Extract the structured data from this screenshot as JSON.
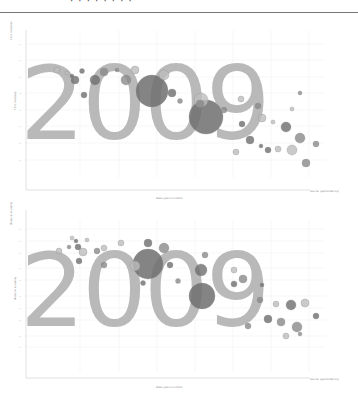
{
  "header": {
    "title": "· ·  · · · · · ·",
    "note": "top caption cut off at image edge"
  },
  "colors": {
    "year_watermark": "#b9b9b9",
    "bubble_dark": "#6e6e6e",
    "bubble_mid": "#8a8a8a",
    "bubble_light": "#bdbdbd",
    "grid": "#eeeeee",
    "axis": "#cccccc"
  },
  "chart_data": [
    {
      "type": "scatter",
      "subtype": "bubble",
      "title": "",
      "watermark": "2009",
      "xlabel": "Mean years in school",
      "ylabel": "Child mortality",
      "x_ticks": [
        "",
        "",
        "",
        "",
        "",
        ""
      ],
      "y_ticks": [
        "",
        "",
        "",
        "",
        "",
        "",
        "",
        ""
      ],
      "grid": true,
      "legend": "",
      "source_note": "",
      "points": [
        {
          "x": 57,
          "y": 70,
          "r": 3
        },
        {
          "x": 67,
          "y": 73,
          "r": 2
        },
        {
          "x": 72,
          "y": 76,
          "r": 2
        },
        {
          "x": 75,
          "y": 80,
          "r": 4
        },
        {
          "x": 82,
          "y": 71,
          "r": 2.5
        },
        {
          "x": 84,
          "y": 95,
          "r": 3
        },
        {
          "x": 95,
          "y": 80,
          "r": 5
        },
        {
          "x": 104,
          "y": 72,
          "r": 4
        },
        {
          "x": 117,
          "y": 70,
          "r": 2
        },
        {
          "x": 126,
          "y": 80,
          "r": 5
        },
        {
          "x": 152,
          "y": 91,
          "r": 16
        },
        {
          "x": 135,
          "y": 70,
          "r": 4
        },
        {
          "x": 164,
          "y": 75,
          "r": 5
        },
        {
          "x": 172,
          "y": 93,
          "r": 4
        },
        {
          "x": 180,
          "y": 101,
          "r": 2.5
        },
        {
          "x": 200,
          "y": 104,
          "r": 4
        },
        {
          "x": 206,
          "y": 117,
          "r": 17
        },
        {
          "x": 201,
          "y": 100,
          "r": 7
        },
        {
          "x": 224,
          "y": 110,
          "r": 3
        },
        {
          "x": 241,
          "y": 99,
          "r": 3
        },
        {
          "x": 242,
          "y": 124,
          "r": 3
        },
        {
          "x": 258,
          "y": 106,
          "r": 3
        },
        {
          "x": 262,
          "y": 118,
          "r": 4
        },
        {
          "x": 273,
          "y": 122,
          "r": 2
        },
        {
          "x": 286,
          "y": 127,
          "r": 5
        },
        {
          "x": 300,
          "y": 138,
          "r": 5
        },
        {
          "x": 292,
          "y": 150,
          "r": 5
        },
        {
          "x": 278,
          "y": 149,
          "r": 3
        },
        {
          "x": 268,
          "y": 150,
          "r": 3
        },
        {
          "x": 261,
          "y": 146,
          "r": 2
        },
        {
          "x": 250,
          "y": 140,
          "r": 4
        },
        {
          "x": 316,
          "y": 144,
          "r": 3
        },
        {
          "x": 306,
          "y": 163,
          "r": 4
        },
        {
          "x": 300,
          "y": 93,
          "r": 2
        },
        {
          "x": 292,
          "y": 109,
          "r": 2
        },
        {
          "x": 236,
          "y": 152,
          "r": 3
        }
      ]
    },
    {
      "type": "scatter",
      "subtype": "bubble",
      "title": "",
      "watermark": "2009",
      "xlabel": "Mean years in school",
      "ylabel": "Maternal mortality",
      "x_ticks": [
        "",
        "",
        "",
        "",
        "",
        ""
      ],
      "y_ticks": [
        "",
        "",
        "",
        "",
        "",
        "",
        "",
        "",
        "",
        "",
        ""
      ],
      "grid": true,
      "legend": "",
      "source_note": "",
      "points": [
        {
          "x": 72,
          "y": 238,
          "r": 2
        },
        {
          "x": 76,
          "y": 241,
          "r": 2
        },
        {
          "x": 59,
          "y": 251,
          "r": 3
        },
        {
          "x": 69,
          "y": 247,
          "r": 2
        },
        {
          "x": 78,
          "y": 247,
          "r": 3
        },
        {
          "x": 83,
          "y": 252,
          "r": 4
        },
        {
          "x": 87,
          "y": 240,
          "r": 2
        },
        {
          "x": 97,
          "y": 251,
          "r": 3
        },
        {
          "x": 104,
          "y": 248,
          "r": 3
        },
        {
          "x": 79,
          "y": 261,
          "r": 3
        },
        {
          "x": 104,
          "y": 265,
          "r": 3
        },
        {
          "x": 121,
          "y": 243,
          "r": 3
        },
        {
          "x": 148,
          "y": 264,
          "r": 15
        },
        {
          "x": 148,
          "y": 243,
          "r": 4
        },
        {
          "x": 164,
          "y": 248,
          "r": 5
        },
        {
          "x": 135,
          "y": 266,
          "r": 5
        },
        {
          "x": 170,
          "y": 265,
          "r": 3
        },
        {
          "x": 143,
          "y": 283,
          "r": 2.5
        },
        {
          "x": 178,
          "y": 281,
          "r": 2.5
        },
        {
          "x": 202,
          "y": 296,
          "r": 13
        },
        {
          "x": 201,
          "y": 270,
          "r": 6
        },
        {
          "x": 205,
          "y": 255,
          "r": 3
        },
        {
          "x": 234,
          "y": 270,
          "r": 3
        },
        {
          "x": 234,
          "y": 284,
          "r": 3
        },
        {
          "x": 243,
          "y": 279,
          "r": 4
        },
        {
          "x": 262,
          "y": 285,
          "r": 2
        },
        {
          "x": 260,
          "y": 300,
          "r": 3
        },
        {
          "x": 276,
          "y": 304,
          "r": 3
        },
        {
          "x": 291,
          "y": 305,
          "r": 5
        },
        {
          "x": 305,
          "y": 303,
          "r": 4
        },
        {
          "x": 268,
          "y": 319,
          "r": 4
        },
        {
          "x": 281,
          "y": 322,
          "r": 4
        },
        {
          "x": 297,
          "y": 327,
          "r": 5
        },
        {
          "x": 316,
          "y": 316,
          "r": 3
        },
        {
          "x": 248,
          "y": 326,
          "r": 3
        },
        {
          "x": 286,
          "y": 336,
          "r": 3
        },
        {
          "x": 300,
          "y": 334,
          "r": 2
        }
      ]
    }
  ],
  "charts": [
    {
      "watermark": "2009",
      "xlabel": "Mean years in school",
      "ylabel": "Child mortality",
      "y_axis_title_top": "Child mortality",
      "source_note": "Source: gapminder.org"
    },
    {
      "watermark": "2009",
      "xlabel": "Mean years in school",
      "ylabel": "Maternal mortality",
      "y_axis_title_top": "Maternal mortality",
      "source_note": "Source: gapminder.org"
    }
  ]
}
